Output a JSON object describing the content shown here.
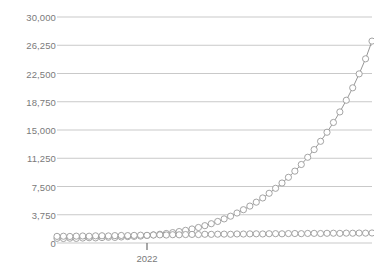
{
  "chart_data": {
    "type": "line",
    "title": "",
    "clipped_top_text": "",
    "xlabel": "",
    "ylabel": "",
    "ylim": [
      0,
      30000
    ],
    "yticks": [
      0,
      3750,
      7500,
      11250,
      15000,
      18750,
      22500,
      26250,
      30000
    ],
    "ytick_labels": [
      "0",
      "3,750",
      "7,500",
      "11,250",
      "15,000",
      "18,750",
      "22,500",
      "26,250",
      "30,000"
    ],
    "xticks": [
      14
    ],
    "xtick_labels": [
      "2022"
    ],
    "grid": true,
    "legend": "none",
    "marker": "open-circle",
    "colors": {
      "grid": "#c9c9c9",
      "series_line": "#8a8a8a",
      "marker_stroke": "#9a9a9a",
      "marker_fill": "#ffffff",
      "tick_text": "#7a7a7a",
      "background": "#ffffff"
    },
    "x": [
      0,
      1,
      2,
      3,
      4,
      5,
      6,
      7,
      8,
      9,
      10,
      11,
      12,
      13,
      14,
      15,
      16,
      17,
      18,
      19,
      20,
      21,
      22,
      23,
      24,
      25,
      26,
      27,
      28,
      29,
      30,
      31,
      32,
      33,
      34,
      35,
      36,
      37,
      38,
      39,
      40,
      41,
      42,
      43,
      44,
      45,
      46,
      47,
      48,
      49
    ],
    "series": [
      {
        "name": "exponential-series",
        "values": [
          620,
          600,
          640,
          610,
          660,
          700,
          680,
          720,
          760,
          740,
          800,
          850,
          880,
          920,
          1000,
          1080,
          1160,
          1260,
          1380,
          1520,
          1680,
          1860,
          2060,
          2300,
          2560,
          2860,
          3200,
          3560,
          3980,
          4420,
          4900,
          5420,
          5980,
          6600,
          7260,
          7960,
          8720,
          9540,
          10420,
          11380,
          12400,
          13500,
          14700,
          16000,
          17400,
          18950,
          20600,
          22450,
          24450,
          26800
        ]
      },
      {
        "name": "flat-series",
        "values": [
          880,
          900,
          870,
          910,
          930,
          900,
          950,
          960,
          940,
          980,
          1000,
          980,
          1010,
          1040,
          1020,
          1060,
          1080,
          1060,
          1100,
          1090,
          1120,
          1140,
          1120,
          1160,
          1150,
          1170,
          1180,
          1160,
          1200,
          1190,
          1210,
          1220,
          1200,
          1230,
          1240,
          1220,
          1250,
          1260,
          1240,
          1270,
          1280,
          1260,
          1290,
          1300,
          1280,
          1310,
          1300,
          1320,
          1310,
          1330
        ]
      }
    ]
  }
}
